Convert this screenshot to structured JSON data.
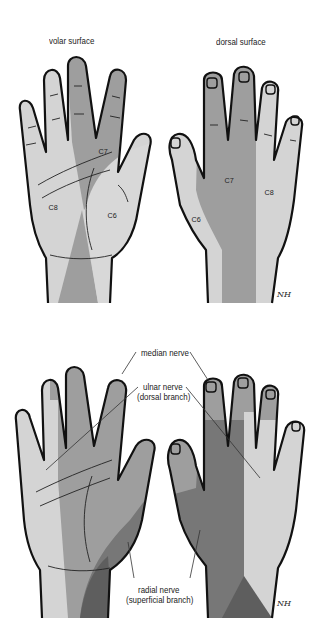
{
  "top_panel": {
    "title": "Dermatomes of the hand",
    "volar_label": "volar surface",
    "dorsal_label": "dorsal surface",
    "volar_segments": {
      "c6": "C6",
      "c7": "C7",
      "c8": "C8"
    },
    "dorsal_segments": {
      "c6": "C6",
      "c7": "C7",
      "c8": "C8"
    },
    "signature": "NH"
  },
  "bottom_panel": {
    "labels": {
      "median": "median nerve",
      "ulnar_line1": "ulnar nerve",
      "ulnar_line2": "(dorsal branch)",
      "radial_line1": "radial nerve",
      "radial_line2": "(superficial branch)"
    },
    "signature": "NH"
  },
  "colors": {
    "background": "#ffffff",
    "light_zone": "#d4d4d4",
    "mid_zone": "#9e9e9e",
    "dark_zone": "#777777",
    "darkest_zone": "#5e5e5e",
    "outline": "#111111"
  }
}
